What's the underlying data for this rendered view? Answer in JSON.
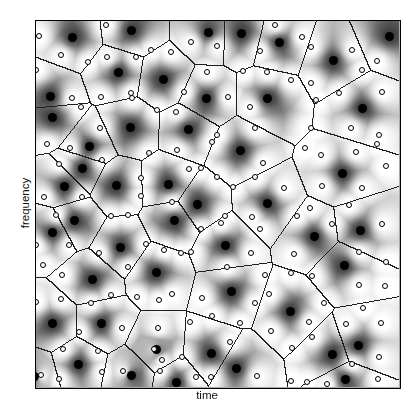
{
  "figure": {
    "type": "scientific-figure",
    "xlabel": "time",
    "ylabel": "frequency",
    "colors": {
      "background": "#ffffff",
      "border": "#000000",
      "maxima": "#000000",
      "zero_fill": "#ffffff",
      "zero_stroke": "#000000",
      "voronoi_line": "#1e1e1e",
      "field_dark": "#373737",
      "field_light": "#ffffff"
    }
  },
  "chart_data": {
    "type": "scatter",
    "title": "",
    "xlabel": "time",
    "ylabel": "frequency",
    "x_axis": {
      "tick_labels": "none"
    },
    "y_axis": {
      "tick_labels": "none"
    },
    "legend": "none",
    "grid": false,
    "plot_size": {
      "width": 363,
      "height": 366
    },
    "overlay": "voronoi-cells-of-maxima",
    "background_field": "grayscale: dark blobs around maxima, white halos around zeros",
    "series": [
      {
        "name": "local maxima",
        "marker": "filled-circle",
        "color": "#000000",
        "radius": 4.5,
        "points": [
          [
            36,
            16
          ],
          [
            95,
            9
          ],
          [
            82,
            51
          ],
          [
            14,
            75
          ],
          [
            16,
            96
          ],
          [
            94,
            106
          ],
          [
            172,
            11
          ],
          [
            205,
            12
          ],
          [
            127,
            58
          ],
          [
            170,
            77
          ],
          [
            231,
            77
          ],
          [
            243,
            21
          ],
          [
            152,
            108
          ],
          [
            297,
            39
          ],
          [
            353,
            15
          ],
          [
            326,
            87
          ],
          [
            53,
            125
          ],
          [
            46,
            147
          ],
          [
            28,
            165
          ],
          [
            80,
            164
          ],
          [
            38,
            199
          ],
          [
            16,
            211
          ],
          [
            84,
            226
          ],
          [
            204,
            129
          ],
          [
            132,
            163
          ],
          [
            161,
            183
          ],
          [
            231,
            182
          ],
          [
            138,
            199
          ],
          [
            189,
            224
          ],
          [
            306,
            152
          ],
          [
            278,
            215
          ],
          [
            324,
            209
          ],
          [
            308,
            244
          ],
          [
            56,
            258
          ],
          [
            16,
            302
          ],
          [
            65,
            302
          ],
          [
            42,
            343
          ],
          [
            95,
            354
          ],
          [
            -2,
            355
          ],
          [
            120,
            251
          ],
          [
            195,
            270
          ],
          [
            120,
            328
          ],
          [
            175,
            332
          ],
          [
            200,
            347
          ],
          [
            140,
            361
          ],
          [
            254,
            290
          ],
          [
            322,
            324
          ],
          [
            296,
            333
          ],
          [
            309,
            358
          ]
        ]
      },
      {
        "name": "zeros",
        "marker": "open-circle",
        "fill": "#ffffff",
        "stroke": "#000000",
        "radius": 3,
        "points": [
          [
            70,
            4
          ],
          [
            3,
            15
          ],
          [
            25,
            34
          ],
          [
            52,
            41
          ],
          [
            71,
            36
          ],
          [
            100,
            36
          ],
          [
            115,
            29
          ],
          [
            0,
            49
          ],
          [
            36,
            77
          ],
          [
            65,
            76
          ],
          [
            45,
            86
          ],
          [
            95,
            72
          ],
          [
            96,
            77
          ],
          [
            64,
            107
          ],
          [
            121,
            89
          ],
          [
            155,
            21
          ],
          [
            135,
            31
          ],
          [
            181,
            25
          ],
          [
            224,
            30
          ],
          [
            239,
            4
          ],
          [
            171,
            51
          ],
          [
            192,
            76
          ],
          [
            148,
            71
          ],
          [
            214,
            86
          ],
          [
            140,
            91
          ],
          [
            181,
            114
          ],
          [
            219,
            107
          ],
          [
            207,
            50
          ],
          [
            231,
            51
          ],
          [
            266,
            16
          ],
          [
            275,
            26
          ],
          [
            316,
            29
          ],
          [
            341,
            40
          ],
          [
            326,
            49
          ],
          [
            255,
            59
          ],
          [
            275,
            62
          ],
          [
            280,
            79
          ],
          [
            303,
            72
          ],
          [
            346,
            71
          ],
          [
            275,
            107
          ],
          [
            315,
            107
          ],
          [
            343,
            114
          ],
          [
            11,
            123
          ],
          [
            34,
            127
          ],
          [
            66,
            139
          ],
          [
            23,
            143
          ],
          [
            8,
            176
          ],
          [
            46,
            176
          ],
          [
            113,
            132
          ],
          [
            105,
            157
          ],
          [
            105,
            175
          ],
          [
            20,
            194
          ],
          [
            75,
            195
          ],
          [
            92,
            194
          ],
          [
            33,
            224
          ],
          [
            63,
            232
          ],
          [
            110,
            223
          ],
          [
            0,
            224
          ],
          [
            141,
            129
          ],
          [
            176,
            121
          ],
          [
            153,
            148
          ],
          [
            165,
            147
          ],
          [
            181,
            156
          ],
          [
            197,
            166
          ],
          [
            227,
            142
          ],
          [
            219,
            156
          ],
          [
            136,
            181
          ],
          [
            189,
            195
          ],
          [
            185,
            202
          ],
          [
            216,
            196
          ],
          [
            224,
            208
          ],
          [
            165,
            208
          ],
          [
            128,
            229
          ],
          [
            145,
            232
          ],
          [
            155,
            231
          ],
          [
            215,
            232
          ],
          [
            269,
            127
          ],
          [
            285,
            134
          ],
          [
            320,
            131
          ],
          [
            341,
            123
          ],
          [
            248,
            167
          ],
          [
            286,
            165
          ],
          [
            326,
            167
          ],
          [
            350,
            145
          ],
          [
            274,
            187
          ],
          [
            261,
            195
          ],
          [
            313,
            184
          ],
          [
            296,
            203
          ],
          [
            346,
            203
          ],
          [
            323,
            231
          ],
          [
            258,
            233
          ],
          [
            350,
            241
          ],
          [
            7,
            244
          ],
          [
            26,
            254
          ],
          [
            92,
            246
          ],
          [
            75,
            274
          ],
          [
            25,
            278
          ],
          [
            55,
            282
          ],
          [
            101,
            276
          ],
          [
            0,
            281
          ],
          [
            43,
            311
          ],
          [
            27,
            328
          ],
          [
            62,
            330
          ],
          [
            86,
            307
          ],
          [
            5,
            354
          ],
          [
            87,
            350
          ],
          [
            118,
            328
          ],
          [
            191,
            246
          ],
          [
            229,
            254
          ],
          [
            123,
            279
          ],
          [
            136,
            273
          ],
          [
            166,
            277
          ],
          [
            219,
            282
          ],
          [
            233,
            273
          ],
          [
            176,
            295
          ],
          [
            154,
            301
          ],
          [
            204,
            302
          ],
          [
            122,
            307
          ],
          [
            235,
            310
          ],
          [
            194,
            321
          ],
          [
            146,
            336
          ],
          [
            124,
            350
          ],
          [
            126,
            339
          ],
          [
            160,
            356
          ],
          [
            175,
            356
          ],
          [
            221,
            355
          ],
          [
            255,
            252
          ],
          [
            276,
            255
          ],
          [
            323,
            264
          ],
          [
            349,
            265
          ],
          [
            288,
            282
          ],
          [
            327,
            287
          ],
          [
            273,
            301
          ],
          [
            310,
            303
          ],
          [
            345,
            302
          ],
          [
            276,
            316
          ],
          [
            256,
            327
          ],
          [
            343,
            336
          ],
          [
            316,
            343
          ],
          [
            255,
            360
          ],
          [
            271,
            361
          ],
          [
            291,
            363
          ],
          [
            342,
            358
          ],
          [
            23,
            358
          ],
          [
            66,
            351
          ]
        ]
      }
    ]
  }
}
